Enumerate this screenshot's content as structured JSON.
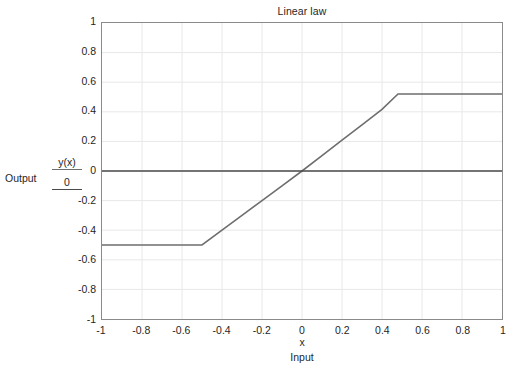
{
  "chart_data": {
    "type": "line",
    "title": "Linear law",
    "xlabel": "x",
    "x_caption": "Input",
    "y_caption": "Output",
    "xlim": [
      -1,
      1
    ],
    "ylim": [
      -1,
      1
    ],
    "grid": true,
    "legend_position": "left-axis",
    "x_ticks": [
      "-1",
      "-0.8",
      "-0.6",
      "-0.4",
      "-0.2",
      "0",
      "0.2",
      "0.4",
      "0.6",
      "0.8",
      "1"
    ],
    "x_tick_values": [
      -1,
      -0.8,
      -0.6,
      -0.4,
      -0.2,
      0,
      0.2,
      0.4,
      0.6,
      0.8,
      1
    ],
    "y_ticks": [
      "1",
      "0.8",
      "0.6",
      "0.4",
      "0.2",
      "0",
      "-0.2",
      "-0.4",
      "-0.6",
      "-0.8",
      "-1"
    ],
    "y_tick_values": [
      1,
      0.8,
      0.6,
      0.4,
      0.2,
      0,
      -0.2,
      -0.4,
      -0.6,
      -0.8,
      -1
    ],
    "series": [
      {
        "name": "y(x)",
        "color": "#6e6e6e",
        "x": [
          -1,
          -0.9,
          -0.8,
          -0.7,
          -0.6,
          -0.52,
          -0.5,
          -0.4,
          -0.3,
          -0.2,
          -0.1,
          0,
          0.1,
          0.2,
          0.3,
          0.4,
          0.48,
          0.5,
          0.6,
          0.7,
          0.8,
          0.9,
          1
        ],
        "values": [
          -0.5,
          -0.5,
          -0.5,
          -0.5,
          -0.5,
          -0.5,
          -0.5,
          -0.4,
          -0.3,
          -0.2,
          -0.1,
          0,
          0.104,
          0.208,
          0.312,
          0.416,
          0.52,
          0.52,
          0.52,
          0.52,
          0.52,
          0.52,
          0.52
        ]
      },
      {
        "name": "0",
        "color": "#4a4a4a",
        "x": [
          -1,
          1
        ],
        "values": [
          0,
          0
        ]
      }
    ],
    "grid_color": "#e8e8e8",
    "frame_color": "#8a8a8a"
  },
  "chart": {
    "title": "Linear law",
    "x_axis_variable": "x",
    "x_axis_caption": "Input",
    "y_axis_caption": "Output"
  },
  "legend": {
    "entries": [
      {
        "label": "y(x)",
        "color": "#6e6e6e"
      },
      {
        "label": "0",
        "color": "#4a4a4a"
      }
    ]
  }
}
